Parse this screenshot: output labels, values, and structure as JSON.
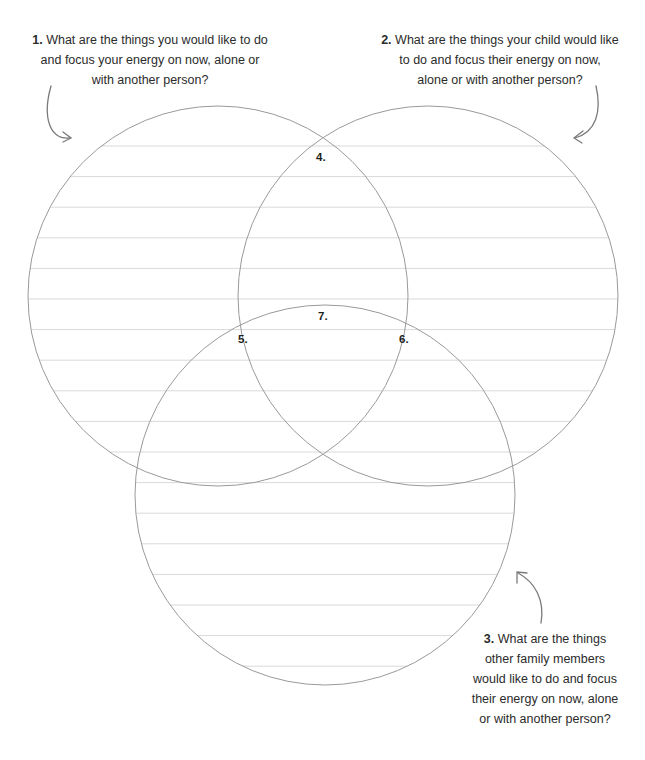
{
  "prompts": [
    {
      "number": "1.",
      "text": "What are the things you would like to do and focus your energy on now, alone or with another person?"
    },
    {
      "number": "2.",
      "text": "What are the things your child would like to do and focus their energy on now, alone or with another person?"
    },
    {
      "number": "3.",
      "text": "What are the things other family members would like to do and focus their energy on now, alone or with another person?"
    }
  ],
  "prompt_lines": {
    "p1": [
      "What are the things you would like to do",
      "and focus your energy on now, alone or",
      "with another person?"
    ],
    "p2": [
      "What are the things your child would like",
      "to do and focus their energy on now,",
      "alone or with another person?"
    ],
    "p3": [
      "What are the things",
      "other family members",
      "would like to do and focus",
      "their energy on now, alone",
      "or with another person?"
    ]
  },
  "region_labels": {
    "r4": "4.",
    "r5": "5.",
    "r6": "6.",
    "r7": "7."
  },
  "circles": [
    {
      "name": "you",
      "cx": 218,
      "cy": 296,
      "r": 190
    },
    {
      "name": "child",
      "cx": 428,
      "cy": 296,
      "r": 190
    },
    {
      "name": "family",
      "cx": 325,
      "cy": 495,
      "r": 190
    }
  ],
  "colors": {
    "circle_stroke": "#9a9a9a",
    "line": "#d9d9d9",
    "arrow": "#7a7a7a",
    "text": "#2b2b2b"
  }
}
